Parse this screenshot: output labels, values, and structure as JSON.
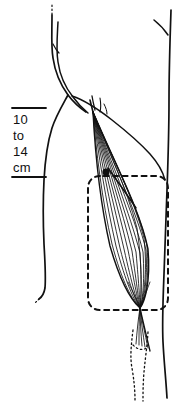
{
  "figure": {
    "background_color": "#ffffff",
    "ink_color": "#111111",
    "width": 193,
    "height": 408
  },
  "measurement": {
    "value_top": "10",
    "connector": "to",
    "value_bottom": "14",
    "unit": "cm",
    "bracket_top_y": 108,
    "bracket_bottom_y": 177,
    "bracket_x_start": 12,
    "bracket_x_end": 46
  },
  "markers": {
    "injection_point": {
      "label": "injection-point",
      "x": 106,
      "y": 172,
      "radius": 3.6,
      "color": "#111111"
    }
  },
  "regions": {
    "dashed_box": {
      "label": "treatment-area-outline",
      "style": "dashed",
      "x": 88,
      "y": 175,
      "width": 80,
      "height": 136
    },
    "dotted_tendon": {
      "label": "distal-tendon-path",
      "style": "dotted"
    }
  },
  "anatomy": {
    "limb_outline": "arm-contour",
    "muscle": "fusiform-muscle-fibers",
    "fiber_count": 13
  }
}
